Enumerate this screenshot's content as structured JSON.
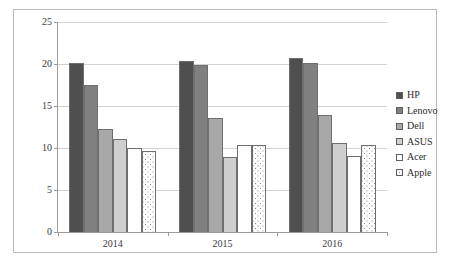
{
  "chart_data": {
    "type": "bar",
    "title": "",
    "subtitle": "",
    "xlabel": "",
    "ylabel": "",
    "categories": [
      "2014",
      "2015",
      "2016"
    ],
    "series": [
      {
        "name": "HP",
        "color": "#4f4f4f",
        "values": [
          20.1,
          20.4,
          20.7
        ]
      },
      {
        "name": "Lenovo",
        "color": "#808080",
        "values": [
          17.5,
          19.9,
          20.1
        ]
      },
      {
        "name": "Dell",
        "color": "#a8a8a8",
        "values": [
          12.3,
          13.6,
          13.9
        ]
      },
      {
        "name": "ASUS",
        "color": "#cfcfcf",
        "values": [
          11.1,
          8.9,
          10.6
        ]
      },
      {
        "name": "Acer",
        "color": "#ffffff",
        "values": [
          10.0,
          10.3,
          9.0
        ]
      },
      {
        "name": "Apple",
        "color": "#ffffff",
        "values": [
          9.7,
          10.3,
          10.3
        ]
      }
    ],
    "yticks": [
      0,
      5,
      10,
      15,
      20,
      25
    ],
    "ylim": [
      0,
      25
    ],
    "grid": true,
    "legend_position": "right"
  },
  "legend": {
    "items": [
      {
        "label": "HP"
      },
      {
        "label": "Lenovo"
      },
      {
        "label": "Dell"
      },
      {
        "label": "ASUS"
      },
      {
        "label": "Acer"
      },
      {
        "label": "Apple"
      }
    ]
  },
  "axes": {
    "y_tick_labels": [
      "0",
      "5",
      "10",
      "15",
      "20",
      "25"
    ],
    "x_tick_labels": [
      "2014",
      "2015",
      "2016"
    ]
  }
}
